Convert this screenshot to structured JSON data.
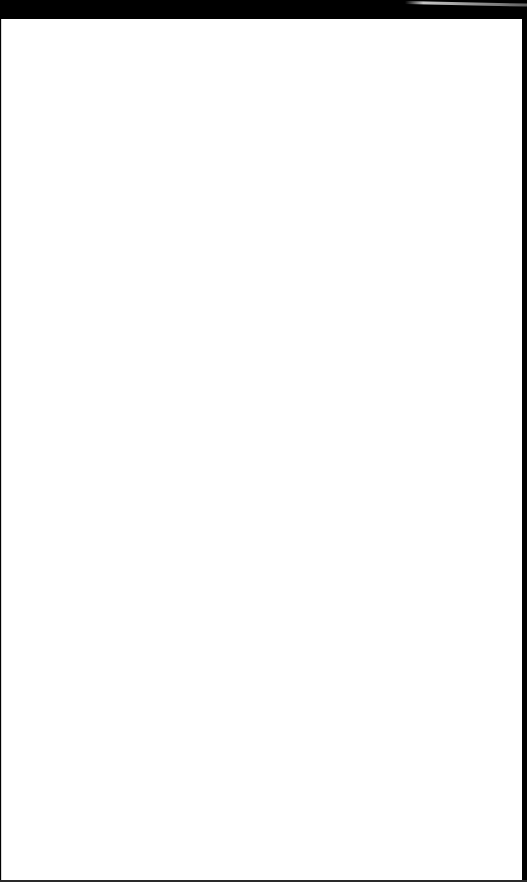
{
  "screen": {
    "state": "blank",
    "colors": {
      "frame": "#000000",
      "page_background": "#ffffff"
    }
  }
}
